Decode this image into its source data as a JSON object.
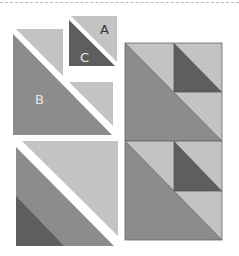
{
  "labels": {
    "a": "A",
    "b": "B",
    "c": "C"
  },
  "colors": {
    "light": "#c3c3c3",
    "medium": "#8c8c8c",
    "dark": "#5e5e5e",
    "seam": "#555555",
    "label_dark": "#333333",
    "label_light": "#e6e6e6"
  },
  "pieces": {
    "small_unit": "A + C half-square triangle unit",
    "large_unit": "B + A half-square triangle unit",
    "corner_unit": "corner unit with three shades",
    "assembled_block": "two assembled units stacked"
  }
}
